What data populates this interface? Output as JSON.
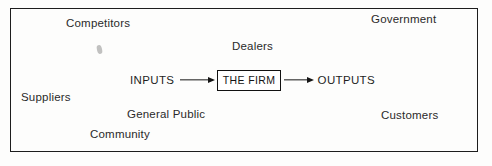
{
  "diagram": {
    "frame": {
      "border_color": "#181818"
    },
    "center_flow": {
      "input_label": "INPUTS",
      "firm_label": "THE FIRM",
      "output_label": "OUTPUTS",
      "input_arrow": "arrow-right-icon",
      "output_arrow": "arrow-right-icon"
    },
    "environment_labels": [
      {
        "id": "competitors",
        "text": "Competitors"
      },
      {
        "id": "government",
        "text": "Government"
      },
      {
        "id": "dealers",
        "text": "Dealers"
      },
      {
        "id": "suppliers",
        "text": "Suppliers"
      },
      {
        "id": "general-public",
        "text": "General Public"
      },
      {
        "id": "community",
        "text": "Community"
      },
      {
        "id": "customers",
        "text": "Customers"
      }
    ]
  }
}
